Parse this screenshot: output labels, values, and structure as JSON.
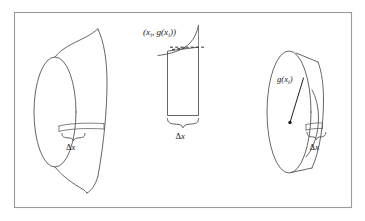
{
  "figure": {
    "title_text": "",
    "caption": "",
    "background_color": "#ffffff",
    "frame_color": "#9a9a9a",
    "ink_color": "#4a4a4a"
  },
  "labels": {
    "point_label": "(x",
    "point_label_sub1": "i",
    "point_label_mid": ", g(x",
    "point_label_sub2": "i",
    "point_label_end": "))",
    "point_label_full": "(xᵢ, g(xᵢ))",
    "delta_x_left": "Δx",
    "delta_x_middle": "Δx",
    "delta_x_right": "Δx",
    "radius_label": "g(x",
    "radius_label_sub": "i",
    "radius_label_end": ")",
    "radius_label_full": "g(xᵢ)",
    "delta_symbol": "Δ",
    "x_symbol": "x",
    "g_symbol": "g",
    "open_paren": "(",
    "close_paren": ")",
    "comma": ","
  },
  "panels": [
    {
      "id": "solid-of-revolution",
      "name": "Solid of revolution with representative slice",
      "delta_x_label": "Δx"
    },
    {
      "id": "representative-rectangle",
      "name": "Representative rectangle under curve",
      "point_label": "(xᵢ, g(xᵢ))",
      "delta_x_label": "Δx"
    },
    {
      "id": "cylindrical-disk",
      "name": "Cylindrical disk of radius g(xᵢ)",
      "radius_label": "g(xᵢ)",
      "delta_x_label": "Δx"
    }
  ]
}
